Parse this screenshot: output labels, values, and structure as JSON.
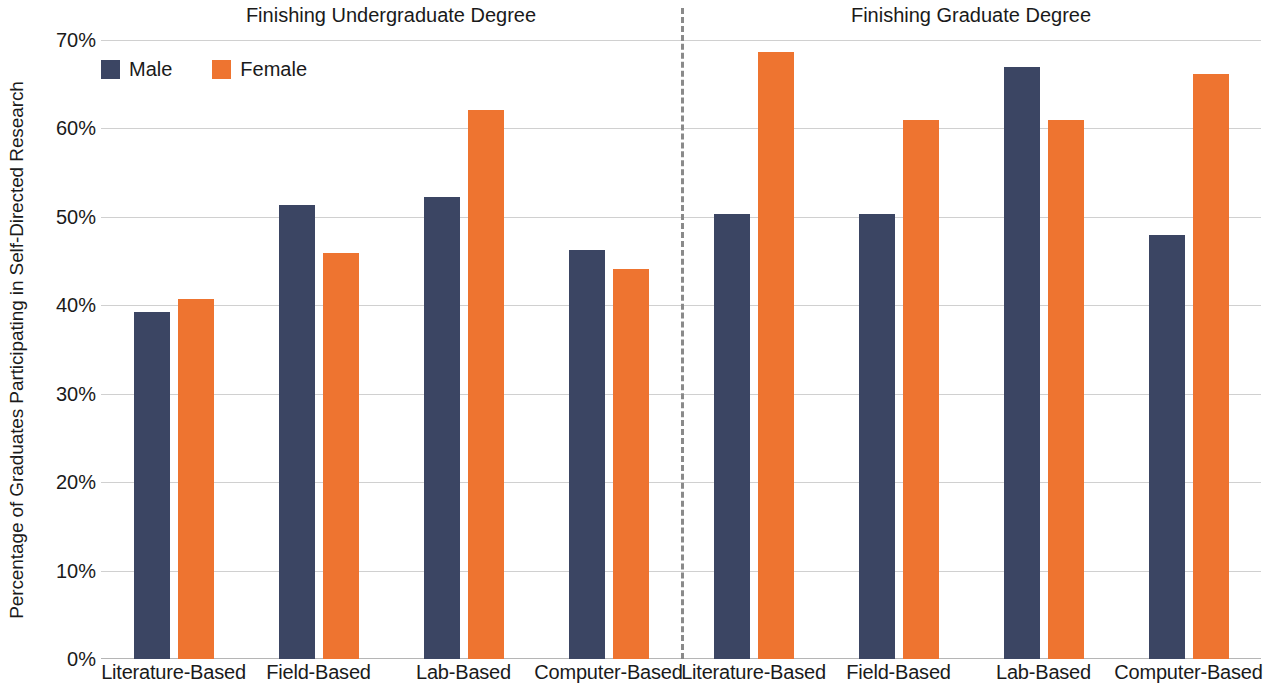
{
  "chart_data": {
    "type": "bar",
    "title": "",
    "xlabel": "",
    "ylabel": "Percentage of Graduates Participating in Self-Directed Research",
    "ylim": [
      0,
      70
    ],
    "ytick_labels": [
      "0%",
      "10%",
      "20%",
      "30%",
      "40%",
      "50%",
      "60%",
      "70%"
    ],
    "ytick_values": [
      0,
      10,
      20,
      30,
      40,
      50,
      60,
      70
    ],
    "grid": true,
    "legend_position": "top-left",
    "panels": [
      {
        "header": "Finishing Undergraduate Degree",
        "categories": [
          "Literature-Based",
          "Field-Based",
          "Lab-Based",
          "Computer-Based"
        ],
        "series": [
          {
            "name": "Male",
            "color": "#3b4563",
            "values": [
              39.2,
              51.3,
              52.3,
              46.3
            ]
          },
          {
            "name": "Female",
            "color": "#ee7430",
            "values": [
              40.7,
              45.9,
              62.1,
              44.1
            ]
          }
        ]
      },
      {
        "header": "Finishing Graduate Degree",
        "categories": [
          "Literature-Based",
          "Field-Based",
          "Lab-Based",
          "Computer-Based"
        ],
        "series": [
          {
            "name": "Male",
            "color": "#3b4563",
            "values": [
              50.3,
              50.3,
              66.9,
              48.0
            ]
          },
          {
            "name": "Female",
            "color": "#ee7430",
            "values": [
              68.7,
              60.9,
              60.9,
              66.2
            ]
          }
        ]
      }
    ],
    "legend": [
      {
        "name": "Male",
        "color": "#3b4563"
      },
      {
        "name": "Female",
        "color": "#ee7430"
      }
    ],
    "divider": {
      "style": "dashed",
      "color": "#8a8a8a"
    }
  }
}
